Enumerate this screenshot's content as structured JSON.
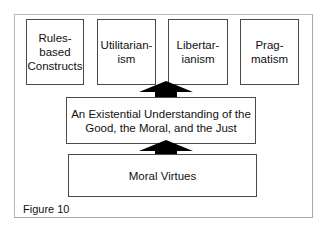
{
  "figure": {
    "caption": "Figure 10",
    "top_boxes": [
      {
        "label": "Rules-based\nConstructs"
      },
      {
        "label": "Utilitarian-\nism"
      },
      {
        "label": "Libertar-\nianism"
      },
      {
        "label": "Prag-\nmatism"
      }
    ],
    "middle_box": {
      "label": "An Existential Understanding of the\nGood, the Moral, and the Just"
    },
    "bottom_box": {
      "label": "Moral Virtues"
    },
    "arrows": [
      {
        "from": "bottom_box",
        "to": "middle_box",
        "direction": "up"
      },
      {
        "from": "middle_box",
        "to": "top_boxes",
        "direction": "up"
      }
    ],
    "colors": {
      "box_border": "#4a4a4a",
      "arrow_fill": "#000000",
      "frame_border": "#b8b8b8"
    }
  }
}
